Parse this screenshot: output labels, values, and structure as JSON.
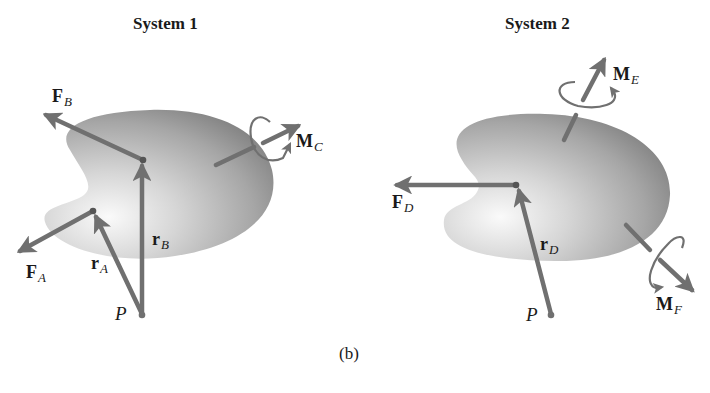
{
  "figure": {
    "caption": "(b)",
    "systems": [
      {
        "title": "System 1",
        "point_label": "P",
        "forces": [
          {
            "symbol": "F",
            "sub": "B"
          },
          {
            "symbol": "F",
            "sub": "A"
          }
        ],
        "position_vectors": [
          {
            "symbol": "r",
            "sub": "A"
          },
          {
            "symbol": "r",
            "sub": "B"
          }
        ],
        "moments": [
          {
            "symbol": "M",
            "sub": "C"
          }
        ]
      },
      {
        "title": "System 2",
        "point_label": "P",
        "forces": [
          {
            "symbol": "F",
            "sub": "D"
          }
        ],
        "position_vectors": [
          {
            "symbol": "r",
            "sub": "D"
          }
        ],
        "moments": [
          {
            "symbol": "M",
            "sub": "E"
          },
          {
            "symbol": "M",
            "sub": "F"
          }
        ]
      }
    ],
    "colors": {
      "vector": "#707070",
      "body_light": "#f2f2f2",
      "body_dark": "#8a8a8a"
    }
  }
}
